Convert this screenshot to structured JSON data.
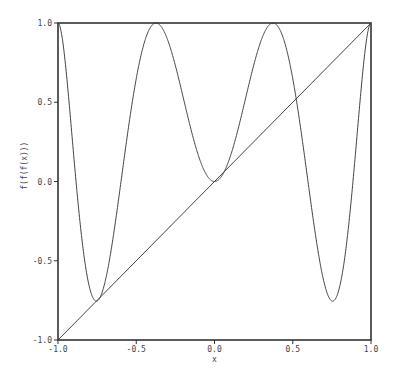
{
  "chart_data": {
    "type": "line",
    "title": "",
    "xlabel": "x",
    "ylabel": "f(f(f(x)))",
    "xlim": [
      -1.0,
      1.0
    ],
    "ylim": [
      -1.0,
      1.0
    ],
    "grid": false,
    "legend": null,
    "x_ticks": [
      "-1.0",
      "-0.5",
      "0.0",
      "0.5",
      "1.0"
    ],
    "y_ticks": [
      "-1.0",
      "-0.5",
      "0.0",
      "0.5",
      "1.0"
    ],
    "series": [
      {
        "name": "f(f(f(x))), f(x)=1-a*x^2",
        "parameter_a": 1.7549,
        "key_points": [
          {
            "x": -1.0,
            "y": 1.0
          },
          {
            "x": -0.75,
            "y": -0.75
          },
          {
            "x": -0.38,
            "y": 1.0
          },
          {
            "x": 0.0,
            "y": 0.03
          },
          {
            "x": 0.38,
            "y": 1.0
          },
          {
            "x": 0.75,
            "y": -0.75
          },
          {
            "x": 1.0,
            "y": 1.0
          }
        ]
      },
      {
        "name": "y = x",
        "key_points": [
          {
            "x": -1.0,
            "y": -1.0
          },
          {
            "x": 1.0,
            "y": 1.0
          }
        ]
      }
    ]
  },
  "colors": {
    "line": "#444444",
    "frame": "#333333",
    "background": "#ffffff"
  }
}
